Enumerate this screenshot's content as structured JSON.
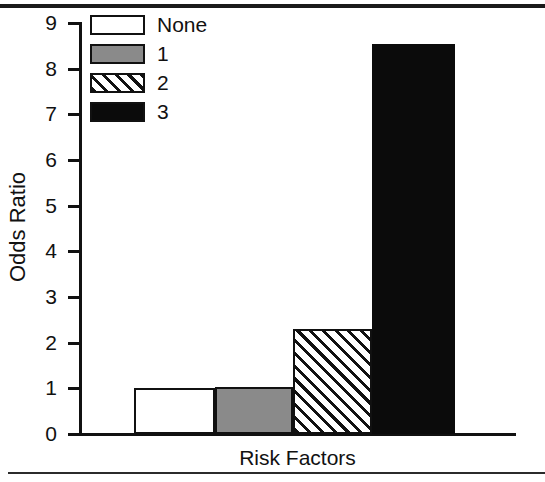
{
  "chart_data": {
    "type": "bar",
    "title": "",
    "xlabel": "Risk Factors",
    "ylabel": "Odds Ratio",
    "categories": [
      "None",
      "1",
      "2",
      "3"
    ],
    "values": [
      1.0,
      1.03,
      2.3,
      8.55
    ],
    "ylim": [
      0,
      9
    ],
    "yticks": [
      0,
      1,
      2,
      3,
      4,
      5,
      6,
      7,
      8,
      9
    ],
    "ytick_labels": [
      "0",
      "1",
      "2",
      "3",
      "4",
      "5",
      "6",
      "7",
      "8",
      "9"
    ],
    "xticks": [],
    "grid": false,
    "legend_position": "top-left",
    "series": [
      {
        "name": "Odds Ratio",
        "values": [
          1.0,
          1.03,
          2.3,
          8.55
        ],
        "fills": [
          "white",
          "gray",
          "diagonal-hatch",
          "black"
        ]
      }
    ],
    "legend": [
      {
        "label": "None",
        "fill": "white",
        "color": "#ffffff"
      },
      {
        "label": "1",
        "fill": "gray",
        "color": "#8a8a8a"
      },
      {
        "label": "2",
        "fill": "diagonal-hatch",
        "color": "#ffffff"
      },
      {
        "label": "3",
        "fill": "black",
        "color": "#0b0b0b"
      }
    ]
  },
  "axis": {
    "y_title": "Odds Ratio",
    "x_title": "Risk Factors"
  }
}
